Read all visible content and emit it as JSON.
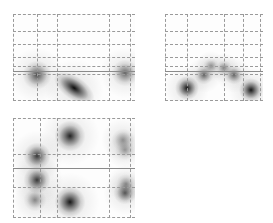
{
  "chart_data": [
    {
      "type": "heatmap",
      "title": "",
      "xlabel": "",
      "ylabel": "",
      "panel": "top-left",
      "grid": {
        "style": "dashed",
        "v_fracs": [
          0.0,
          0.2,
          0.36,
          0.79,
          0.96
        ],
        "h_fracs": [
          0.0,
          0.19,
          0.34,
          0.49,
          0.6,
          0.69,
          0.99
        ],
        "solid_h_frac": 0.66
      },
      "blobs": [
        {
          "x": 0.2,
          "y": 0.7,
          "intensity": 0.65,
          "size": 0.15
        },
        {
          "x": 0.5,
          "y": 0.85,
          "intensity": 0.95,
          "size": 0.16,
          "elongated": true,
          "angle": 35
        },
        {
          "x": 0.92,
          "y": 0.68,
          "intensity": 0.55,
          "size": 0.14
        }
      ]
    },
    {
      "type": "heatmap",
      "title": "",
      "xlabel": "",
      "ylabel": "",
      "panel": "top-right",
      "grid": {
        "style": "dashed",
        "v_fracs": [
          0.0,
          0.22,
          0.6,
          0.8,
          0.97
        ],
        "h_fracs": [
          0.0,
          0.19,
          0.34,
          0.49,
          0.6,
          0.69,
          0.99
        ],
        "solid_h_frac": 0.66
      },
      "blobs": [
        {
          "x": 0.22,
          "y": 0.85,
          "intensity": 0.9,
          "size": 0.15
        },
        {
          "x": 0.4,
          "y": 0.7,
          "intensity": 0.55,
          "size": 0.12
        },
        {
          "x": 0.47,
          "y": 0.6,
          "intensity": 0.35,
          "size": 0.1
        },
        {
          "x": 0.6,
          "y": 0.62,
          "intensity": 0.4,
          "size": 0.1
        },
        {
          "x": 0.7,
          "y": 0.7,
          "intensity": 0.55,
          "size": 0.12
        },
        {
          "x": 0.88,
          "y": 0.87,
          "intensity": 0.9,
          "size": 0.15
        }
      ]
    },
    {
      "type": "heatmap",
      "title": "",
      "xlabel": "",
      "ylabel": "",
      "panel": "bottom-left",
      "grid": {
        "style": "dashed",
        "v_fracs": [
          0.0,
          0.22,
          0.36,
          0.79,
          0.96
        ],
        "h_fracs": [
          0.0,
          0.36,
          0.69,
          0.99
        ],
        "solid_h_frac": 0.5
      },
      "blobs": [
        {
          "x": 0.47,
          "y": 0.18,
          "intensity": 0.85,
          "size": 0.16
        },
        {
          "x": 0.2,
          "y": 0.38,
          "intensity": 0.75,
          "size": 0.14
        },
        {
          "x": 0.2,
          "y": 0.62,
          "intensity": 0.75,
          "size": 0.14
        },
        {
          "x": 0.47,
          "y": 0.84,
          "intensity": 0.9,
          "size": 0.16
        },
        {
          "x": 0.18,
          "y": 0.82,
          "intensity": 0.4,
          "size": 0.12
        },
        {
          "x": 0.9,
          "y": 0.22,
          "intensity": 0.35,
          "size": 0.12
        },
        {
          "x": 0.92,
          "y": 0.32,
          "intensity": 0.3,
          "size": 0.1
        },
        {
          "x": 0.92,
          "y": 0.75,
          "intensity": 0.6,
          "size": 0.12
        },
        {
          "x": 0.93,
          "y": 0.66,
          "intensity": 0.35,
          "size": 0.1
        }
      ]
    }
  ],
  "panels": [
    {
      "id": "top-left",
      "left": 13,
      "top": 14,
      "width": 122,
      "height": 87
    },
    {
      "id": "top-right",
      "left": 165,
      "top": 14,
      "width": 98,
      "height": 87
    },
    {
      "id": "bottom-left",
      "left": 13,
      "top": 118,
      "width": 122,
      "height": 100
    }
  ]
}
